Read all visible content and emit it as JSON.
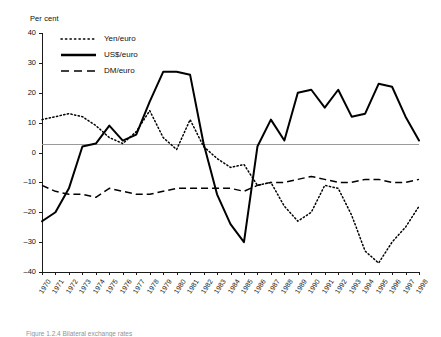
{
  "figure": {
    "unit_label": "Per cent",
    "caption": "Figure 1.2.4  Bilateral exchange rates"
  },
  "legend": {
    "position": "top-left-inside",
    "items": [
      {
        "label": "Yen/euro",
        "style": "dotted"
      },
      {
        "label": "US$/euro",
        "style": "solid"
      },
      {
        "label": "DM/euro",
        "style": "dashed"
      }
    ]
  },
  "axes": {
    "y_label": "Per cent",
    "y_ticks": [
      40,
      30,
      20,
      10,
      0,
      -10,
      -20,
      -30,
      -40
    ],
    "y_min": -40,
    "y_max": 40,
    "x_label": "",
    "reference_line_value": 3,
    "reference_line_color": "#9a9a9a",
    "grid": "none"
  },
  "chart_data": {
    "type": "line",
    "title": "",
    "subtitle": "",
    "xlabel": "",
    "ylabel": "Per cent",
    "ylim": [
      -40,
      40
    ],
    "grid": false,
    "legend_position": "top-left",
    "annotations": [
      {
        "type": "hline",
        "value": 3,
        "color": "#9a9a9a"
      }
    ],
    "categories": [
      "1970",
      "1971",
      "1972",
      "1973",
      "1974",
      "1975",
      "1976",
      "1977",
      "1978",
      "1979",
      "1980",
      "1981",
      "1982",
      "1983",
      "1984",
      "1985",
      "1986",
      "1987",
      "1988",
      "1989",
      "1990",
      "1991",
      "1992",
      "1993",
      "1994",
      "1995",
      "1996",
      "1997",
      "1998"
    ],
    "series": [
      {
        "name": "Yen/euro",
        "style": "dotted",
        "color": "#000000",
        "values": [
          11,
          12,
          13,
          12,
          9,
          5,
          3,
          7,
          14,
          5,
          1,
          11,
          2,
          -2,
          -5,
          -4,
          -11,
          -10,
          -18,
          -23,
          -20,
          -11,
          -12,
          -21,
          -33,
          -37,
          -30,
          -25,
          -18
        ]
      },
      {
        "name": "US$/euro",
        "style": "solid",
        "color": "#000000",
        "values": [
          -23,
          -20,
          -12,
          2,
          3,
          9,
          4,
          6,
          17,
          27,
          27,
          26,
          3,
          -14,
          -24,
          -30,
          2,
          11,
          4,
          20,
          21,
          15,
          21,
          12,
          13,
          23,
          22,
          12,
          4
        ]
      },
      {
        "name": "DM/euro",
        "style": "dashed",
        "color": "#000000",
        "values": [
          -11,
          -13,
          -14,
          -14,
          -15,
          -12,
          -13,
          -14,
          -14,
          -13,
          -12,
          -12,
          -12,
          -12,
          -12,
          -13,
          -11,
          -10,
          -10,
          -9,
          -8,
          -9,
          -10,
          -10,
          -9,
          -9,
          -10,
          -10,
          -9
        ]
      }
    ]
  }
}
